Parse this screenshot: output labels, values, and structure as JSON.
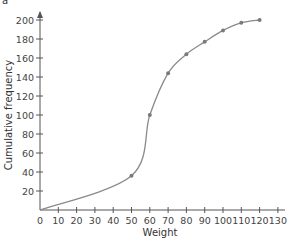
{
  "corner_label": "a",
  "colors": {
    "axis": "#555555",
    "curve": "#8a8a8a",
    "point": "#7a7a7a",
    "text": "#444444"
  },
  "chart_data": {
    "type": "line",
    "title": "",
    "xlabel": "Weight",
    "ylabel": "Cumulative frequency",
    "xlim": [
      0,
      130
    ],
    "ylim": [
      0,
      200
    ],
    "xticks": [
      0,
      10,
      20,
      30,
      40,
      50,
      60,
      70,
      80,
      90,
      100,
      110,
      120,
      130
    ],
    "yticks": [
      20,
      40,
      60,
      80,
      100,
      120,
      140,
      160,
      180,
      200
    ],
    "grid": false,
    "legend": null,
    "series": [
      {
        "name": "Cumulative frequency",
        "x": [
          0,
          50,
          60,
          70,
          80,
          90,
          100,
          110,
          120
        ],
        "values": [
          0,
          36,
          100,
          144,
          164,
          177,
          189,
          197,
          200
        ],
        "marked_points": [
          50,
          60,
          70,
          80,
          90,
          100,
          110,
          120
        ]
      }
    ]
  }
}
